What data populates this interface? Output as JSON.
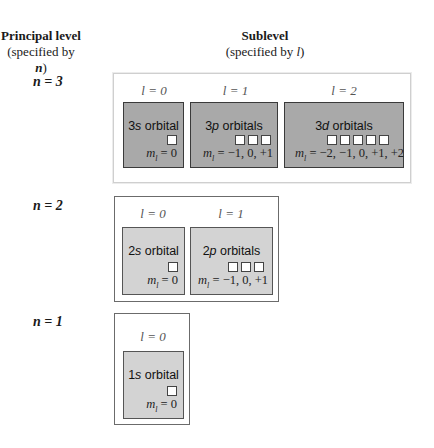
{
  "headers": {
    "principal_line1": "Principal level",
    "principal_line2_prefix": "(specified by ",
    "principal_var": "n",
    "principal_line2_suffix": ")",
    "sublevel_line1": "Sublevel",
    "sublevel_line2_prefix": "(specified by ",
    "sublevel_var": "l",
    "sublevel_line2_suffix": ")"
  },
  "levels": [
    {
      "n_label": "n = 3",
      "sublevels": [
        {
          "l_label": "l = 0",
          "num": "3",
          "letter": "s",
          "word": "orbital",
          "squares": 1,
          "ml": "= 0"
        },
        {
          "l_label": "l = 1",
          "num": "3",
          "letter": "p",
          "word": "orbitals",
          "squares": 3,
          "ml": "= −1, 0, +1"
        },
        {
          "l_label": "l = 2",
          "num": "3",
          "letter": "d",
          "word": "orbitals",
          "squares": 5,
          "ml": "= −2, −1, 0, +1, +2"
        }
      ]
    },
    {
      "n_label": "n = 2",
      "sublevels": [
        {
          "l_label": "l = 0",
          "num": "2",
          "letter": "s",
          "word": "orbital",
          "squares": 1,
          "ml": "= 0"
        },
        {
          "l_label": "l = 1",
          "num": "2",
          "letter": "p",
          "word": "orbitals",
          "squares": 3,
          "ml": "= −1, 0, +1"
        }
      ]
    },
    {
      "n_label": "n = 1",
      "sublevels": [
        {
          "l_label": "l = 0",
          "num": "1",
          "letter": "s",
          "word": "orbital",
          "squares": 1,
          "ml": "= 0"
        }
      ]
    }
  ],
  "colors": {
    "n3_fill": "#a9a9a9",
    "n2_fill": "#d3d3d3",
    "n1_fill": "#d3d3d3"
  }
}
